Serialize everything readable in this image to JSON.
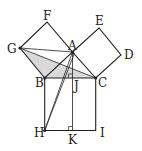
{
  "figure": {
    "points": {
      "F": [
        47,
        22
      ],
      "E": [
        99,
        28
      ],
      "G": [
        20,
        48
      ],
      "A": [
        72.5,
        52
      ],
      "D": [
        121,
        55
      ],
      "B": [
        44.7,
        78
      ],
      "C": [
        95.7,
        78
      ],
      "J": [
        72.5,
        78
      ],
      "H": [
        44.7,
        130.5
      ],
      "K": [
        72.5,
        130.5
      ],
      "I": [
        95.7,
        130.5
      ]
    },
    "labels": [
      {
        "text": "F",
        "x": 43,
        "y": 20
      },
      {
        "text": "E",
        "x": 95,
        "y": 25
      },
      {
        "text": "G",
        "x": 7,
        "y": 53
      },
      {
        "text": "A",
        "x": 68,
        "y": 50
      },
      {
        "text": "D",
        "x": 124,
        "y": 59
      },
      {
        "text": "B",
        "x": 35,
        "y": 87
      },
      {
        "text": "J",
        "x": 74,
        "y": 90
      },
      {
        "text": "C",
        "x": 98,
        "y": 87
      },
      {
        "text": "H",
        "x": 34,
        "y": 137
      },
      {
        "text": "K",
        "x": 68,
        "y": 144
      },
      {
        "text": "I",
        "x": 100,
        "y": 137
      }
    ],
    "shaded_triangle": "G-B-C",
    "shade_color": "#d9d9d9",
    "line_color": "#222222"
  }
}
